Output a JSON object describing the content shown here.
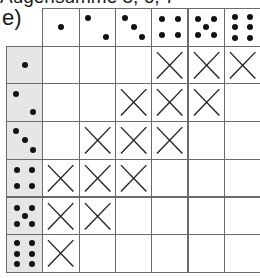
{
  "title": "Augensumme 5, 6, 7",
  "label": "e)",
  "grid": {
    "columns": [
      1,
      2,
      3,
      4,
      5,
      6
    ],
    "rows": [
      1,
      2,
      3,
      4,
      5,
      6
    ],
    "marks": [
      [
        false,
        false,
        false,
        true,
        true,
        true
      ],
      [
        false,
        false,
        true,
        true,
        true,
        false
      ],
      [
        false,
        true,
        true,
        true,
        false,
        false
      ],
      [
        true,
        true,
        true,
        false,
        false,
        false
      ],
      [
        true,
        true,
        false,
        false,
        false,
        false
      ],
      [
        true,
        false,
        false,
        false,
        false,
        false
      ]
    ]
  },
  "colors": {
    "header_bg": "#e6e6e6",
    "line": "#6a6a6a",
    "ink": "#111111"
  }
}
